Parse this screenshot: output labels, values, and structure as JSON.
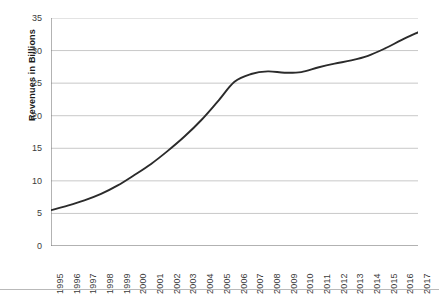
{
  "chart_data": {
    "type": "line",
    "title": "",
    "subtitle": "",
    "xlabel": "",
    "ylabel": "Revenues in Billions",
    "categories": [
      "1995",
      "1996",
      "1997",
      "1998",
      "1999",
      "2000",
      "2001",
      "2002",
      "2003",
      "2004",
      "2005",
      "2006",
      "2007",
      "2008",
      "2009",
      "2010",
      "2011",
      "2012",
      "2013",
      "2014",
      "2015",
      "2016",
      "2017"
    ],
    "series": [
      {
        "name": "Revenues",
        "values": [
          5.5,
          6.2,
          7.0,
          8.0,
          9.3,
          10.9,
          12.6,
          14.6,
          16.8,
          19.3,
          22.2,
          25.2,
          26.4,
          26.8,
          26.6,
          26.7,
          27.4,
          28.0,
          28.5,
          29.2,
          30.3,
          31.6,
          32.8
        ]
      }
    ],
    "ylim": [
      0,
      35
    ],
    "yticks": [
      0,
      5,
      10,
      15,
      20,
      25,
      30,
      35
    ],
    "grid": "horizontal",
    "legend": "none",
    "line_color": "#2b2b2b",
    "gridline_color": "#c8c8c8",
    "axis_color": "#808080",
    "background_color": "#ffffff"
  },
  "axes": {
    "y_title": "Revenues in Billions"
  }
}
